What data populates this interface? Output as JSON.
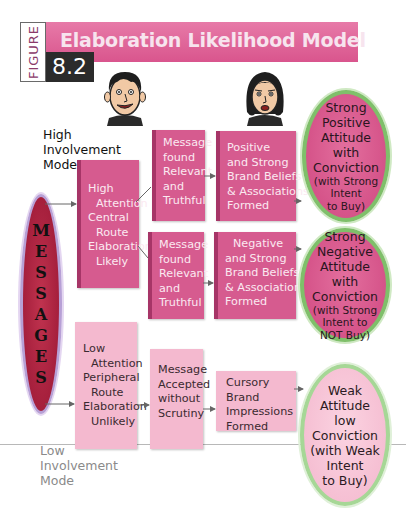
{
  "header": {
    "figure_label": "FIGURE",
    "figure_number": "8.2",
    "title": "Elaboration Likelihood Model"
  },
  "colors": {
    "title_bar": "#d9558d",
    "box_dark": "#d65b8f",
    "box_light": "#f4b9cf",
    "messages_fill": "#a51f3c",
    "messages_border": "#b7a0d6",
    "oval_border_green": "#7fbf6a",
    "figure_number_bg": "#2b2b2b"
  },
  "icons": {
    "male_face": "male-face-icon",
    "female_face": "female-face-icon"
  },
  "modes": {
    "high": [
      "High",
      "Involvement",
      "Mode"
    ],
    "low": [
      "Low",
      "Involvement",
      "Mode"
    ]
  },
  "messages": {
    "letters": [
      "M",
      "E",
      "S",
      "S",
      "A",
      "G",
      "E",
      "S"
    ]
  },
  "central_route": {
    "attention": [
      "High",
      "Attention",
      "Central",
      "Route",
      "Elaboration",
      "Likely"
    ],
    "positive_path": {
      "message": [
        "Message",
        "found",
        "Relevant",
        "and",
        "Truthful"
      ],
      "beliefs": [
        "Positive",
        "and Strong",
        "Brand Beliefs",
        "& Associations",
        "Formed"
      ],
      "outcome_main": [
        "Strong",
        "Positive",
        "Attitude",
        "with",
        "Conviction"
      ],
      "outcome_note": [
        "(with Strong",
        "Intent",
        "to Buy)"
      ]
    },
    "negative_path": {
      "message": [
        "Message",
        "found",
        "Relevant",
        "and",
        "Truthful"
      ],
      "beliefs": [
        "Negative",
        "and Strong",
        "Brand Beliefs",
        "& Associations",
        "Formed"
      ],
      "outcome_main": [
        "Strong",
        "Negative",
        "Attitude",
        "with",
        "Conviction"
      ],
      "outcome_note": [
        "(with Strong",
        "Intent to",
        "NOT Buy)"
      ]
    }
  },
  "peripheral_route": {
    "attention": [
      "Low",
      "Attention",
      "Peripheral",
      "Route",
      "Elaboration",
      "Unlikely"
    ],
    "message": [
      "Message",
      "Accepted",
      "without",
      "Scrutiny"
    ],
    "beliefs": [
      "Cursory",
      "Brand",
      "Impressions",
      "Formed"
    ],
    "outcome_main": [
      "Weak",
      "Attitude",
      "low",
      "Conviction"
    ],
    "outcome_note": [
      "(with Weak",
      "Intent",
      "to Buy)"
    ]
  }
}
